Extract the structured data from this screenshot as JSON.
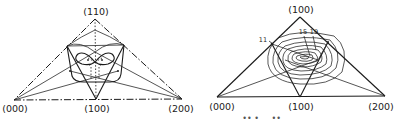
{
  "diagrams": [
    {
      "id": "left",
      "vertices": {
        "apex": "(110)",
        "bottom_left": "(000)",
        "bottom_mid": "(100)",
        "bottom_right": "(200)"
      },
      "edge_style": "dash-dot"
    },
    {
      "id": "right",
      "vertices": {
        "apex": "(100)",
        "bottom_left": "(000)",
        "bottom_mid": "(100)",
        "bottom_right": "(200)"
      },
      "edge_style": "solid",
      "contour_labels": [
        "11",
        "15",
        "19"
      ]
    }
  ],
  "caption_fragment": "... •• • ... ••"
}
